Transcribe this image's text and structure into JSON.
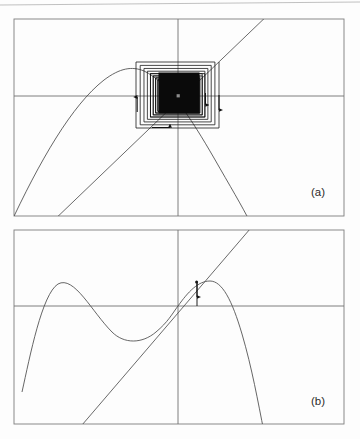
{
  "figure": {
    "background_color": "#fdfdfd",
    "ink_color": "#585858",
    "axis_color": "#6a6a6a",
    "frame_color": "#7a7a7a",
    "curve_color": "#4a4a4a",
    "diagonal_color": "#4a4a4a",
    "cobweb_color": "#1a1a1a",
    "width": 360,
    "height": 439,
    "scan_artifact": {
      "description": "faint slanted scanner line across top of page",
      "color": "#b9b9b9",
      "x1": 0,
      "y1": 5,
      "x2": 360,
      "y2": 2
    }
  },
  "panels": [
    {
      "id": "a",
      "label": "(a)",
      "label_x": 318,
      "label_y": 196,
      "frame": {
        "x": 14,
        "y": 19,
        "width": 330,
        "height": 197
      },
      "axes": {
        "x_axis_y": 96,
        "y_axis_x": 178,
        "show_x_axis": true,
        "show_y_axis": true
      },
      "curve": {
        "type": "parabola",
        "description": "downward-opening parabola, vertex left of origin, crosses frame at both ends",
        "vertex_x": 133,
        "vertex_y": 69,
        "left_end_x": 14,
        "left_end_y": 216,
        "right_end_x": 244,
        "right_end_y": 216
      },
      "diagonal": {
        "description": "identity line y = x, slope positive, through fixed point",
        "x1": 58,
        "y1": 216,
        "x2": 263,
        "y2": 19
      },
      "fixed_point": {
        "x": 178,
        "y": 96,
        "label": "attracting spiral center"
      },
      "cobweb": {
        "type": "converging-square-spiral",
        "description": "rectangular staircase spiral converging to the fixed point; inner iterations overlap into a solid black block",
        "outer_left": 136,
        "outer_right": 219,
        "outer_top": 62,
        "outer_bottom": 128,
        "turns": 26,
        "shrink_ratio": 0.9,
        "solid_core": {
          "x": 158,
          "y": 72,
          "width": 42,
          "height": 42
        },
        "arrows": [
          {
            "edge": "left",
            "x": 138,
            "y": 100,
            "direction": "up"
          },
          {
            "edge": "right",
            "x": 214,
            "y": 107,
            "direction": "down"
          },
          {
            "edge": "bottom",
            "x": 168,
            "y": 126,
            "direction": "right"
          },
          {
            "edge": "inner-right",
            "x": 205,
            "y": 103,
            "direction": "down"
          }
        ]
      }
    },
    {
      "id": "b",
      "label": "(b)",
      "label_x": 318,
      "label_y": 405,
      "frame": {
        "x": 14,
        "y": 230,
        "width": 330,
        "height": 194
      },
      "axes": {
        "x_axis_y": 306,
        "y_axis_x": 178,
        "show_x_axis": true,
        "show_y_axis": true
      },
      "curve": {
        "type": "cubic-like",
        "description": "rises from lower-left to a local maximum, dips to a local minimum, rises through the origin to a second maximum, then falls steeply off the bottom",
        "local_max_1": {
          "x": 57,
          "y": 284
        },
        "local_min": {
          "x": 133,
          "y": 339
        },
        "origin_crossing": {
          "x": 178,
          "y": 306
        },
        "local_max_2": {
          "x": 212,
          "y": 281
        },
        "left_end": {
          "x": 29,
          "y": 374
        },
        "right_end": {
          "x": 261,
          "y": 424
        }
      },
      "diagonal": {
        "description": "identity line y = x, tangent to the curve near the fixed point",
        "x1": 84,
        "y1": 424,
        "x2": 248,
        "y2": 230
      },
      "fixed_point": {
        "x": 178,
        "y": 306,
        "label": "tangent / neutral fixed point"
      },
      "cobweb": {
        "type": "single-vertical-step",
        "description": "short vertical segment from the curve down toward the x-axis with a downward arrowhead",
        "x": 197,
        "y_top": 281,
        "y_bottom": 306,
        "arrow_y": 296,
        "direction": "down"
      }
    }
  ]
}
